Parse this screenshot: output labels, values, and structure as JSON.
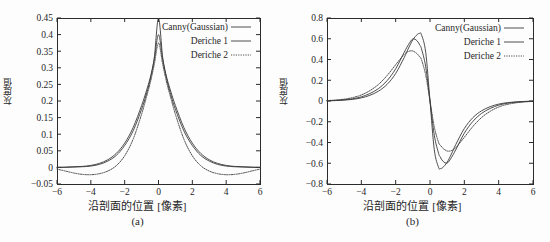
{
  "figure": {
    "background": "#fdfdfd",
    "axis_color": "#2b2b2b",
    "curve_color": "#3a3a3a"
  },
  "panels": [
    {
      "id": "a",
      "caption": "(a)",
      "xlabel": "沿剖面的位置 [像素]",
      "ylabel": "灰度值"
    },
    {
      "id": "b",
      "caption": "(b)",
      "xlabel": "沿剖面的位置 [像素]",
      "ylabel": "灰度值"
    }
  ],
  "legend": {
    "items": [
      {
        "label": "Canny(Gaussian)",
        "style": "solid"
      },
      {
        "label": "Deriche 1",
        "style": "solid"
      },
      {
        "label": "Deriche 2",
        "style": "dotted"
      }
    ]
  },
  "chart_data": [
    {
      "type": "line",
      "panel": "a",
      "title": "",
      "xlabel": "沿剖面的位置 [像素]",
      "ylabel": "灰度值",
      "xlim": [
        -6,
        6
      ],
      "ylim": [
        -0.05,
        0.45
      ],
      "xticks": [
        -6,
        -4,
        -2,
        0,
        2,
        4,
        6
      ],
      "yticks": [
        -0.05,
        0,
        0.05,
        0.1,
        0.15,
        0.2,
        0.25,
        0.3,
        0.35,
        0.4,
        0.45
      ],
      "ytick_labels": [
        "-0.05",
        "0",
        "0.05",
        "0.1",
        "0.15",
        "0.2",
        "0.25",
        "0.3",
        "0.35",
        "0.4",
        "0.45"
      ],
      "xtick_labels": [
        "-6",
        "-4",
        "-2",
        "0",
        "2",
        "4",
        "6"
      ],
      "grid": false,
      "legend_position": "top-right",
      "x": [
        -6,
        -5.5,
        -5,
        -4.5,
        -4,
        -3.5,
        -3,
        -2.5,
        -2,
        -1.5,
        -1,
        -0.75,
        -0.5,
        -0.25,
        0,
        0.25,
        0.5,
        0.75,
        1,
        1.5,
        2,
        2.5,
        3,
        3.5,
        4,
        4.5,
        5,
        5.5,
        6
      ],
      "series": [
        {
          "name": "Canny(Gaussian)",
          "style": "solid",
          "values": [
            0.0,
            0.0,
            0.001,
            0.002,
            0.004,
            0.009,
            0.019,
            0.036,
            0.066,
            0.11,
            0.175,
            0.215,
            0.262,
            0.33,
            0.45,
            0.33,
            0.262,
            0.215,
            0.175,
            0.11,
            0.066,
            0.036,
            0.019,
            0.009,
            0.004,
            0.002,
            0.001,
            0.0,
            0.0
          ]
        },
        {
          "name": "Deriche 1",
          "style": "solid",
          "values": [
            0.0,
            0.001,
            0.002,
            0.003,
            0.006,
            0.012,
            0.023,
            0.042,
            0.073,
            0.12,
            0.186,
            0.225,
            0.268,
            0.325,
            0.4,
            0.325,
            0.268,
            0.225,
            0.186,
            0.12,
            0.073,
            0.042,
            0.023,
            0.012,
            0.006,
            0.003,
            0.002,
            0.001,
            0.0
          ]
        },
        {
          "name": "Deriche 2",
          "style": "dotted",
          "values": [
            -0.005,
            -0.011,
            -0.017,
            -0.021,
            -0.022,
            -0.019,
            -0.011,
            0.005,
            0.035,
            0.085,
            0.16,
            0.205,
            0.252,
            0.31,
            0.375,
            0.31,
            0.252,
            0.205,
            0.16,
            0.085,
            0.035,
            0.005,
            -0.011,
            -0.019,
            -0.022,
            -0.021,
            -0.017,
            -0.011,
            -0.005
          ]
        }
      ],
      "annotations": {
        "peaks": [
          {
            "series": "Canny(Gaussian)",
            "x": 0,
            "y": 0.45
          },
          {
            "series": "Deriche 1",
            "x": 0,
            "y": 0.4
          },
          {
            "series": "Deriche 2",
            "x": 0,
            "y": 0.375
          }
        ],
        "undershoot": [
          {
            "series": "Deriche 2",
            "x": -4,
            "y": -0.022
          },
          {
            "series": "Deriche 2",
            "x": 4,
            "y": -0.022
          }
        ]
      }
    },
    {
      "type": "line",
      "panel": "b",
      "title": "",
      "xlabel": "沿剖面的位置 [像素]",
      "ylabel": "灰度值",
      "xlim": [
        -6,
        6
      ],
      "ylim": [
        -0.8,
        0.8
      ],
      "xticks": [
        -6,
        -4,
        -2,
        0,
        2,
        4,
        6
      ],
      "yticks": [
        -0.8,
        -0.6,
        -0.4,
        -0.2,
        0,
        0.2,
        0.4,
        0.6,
        0.8
      ],
      "ytick_labels": [
        "-0.8",
        "-0.6",
        "-0.4",
        "-0.2",
        "0",
        "0.2",
        "0.4",
        "0.6",
        "0.8"
      ],
      "xtick_labels": [
        "-6",
        "-4",
        "-2",
        "0",
        "2",
        "4",
        "6"
      ],
      "grid": false,
      "legend_position": "top-right",
      "x": [
        -6,
        -5.5,
        -5,
        -4.5,
        -4,
        -3.5,
        -3,
        -2.5,
        -2,
        -1.5,
        -1.25,
        -1,
        -0.75,
        -0.6,
        -0.5,
        -0.25,
        0,
        0.25,
        0.5,
        0.6,
        0.75,
        1,
        1.25,
        1.5,
        2,
        2.5,
        3,
        3.5,
        4,
        4.5,
        5,
        5.5,
        6
      ],
      "series": [
        {
          "name": "Canny(Gaussian)",
          "style": "solid",
          "values": [
            0.002,
            0.004,
            0.008,
            0.016,
            0.03,
            0.055,
            0.095,
            0.16,
            0.265,
            0.42,
            0.51,
            0.59,
            0.64,
            0.652,
            0.64,
            0.47,
            0.0,
            -0.47,
            -0.64,
            -0.652,
            -0.64,
            -0.59,
            -0.51,
            -0.42,
            -0.265,
            -0.16,
            -0.095,
            -0.055,
            -0.03,
            -0.016,
            -0.008,
            -0.004,
            -0.002
          ]
        },
        {
          "name": "Deriche 1",
          "style": "solid",
          "values": [
            0.003,
            0.006,
            0.012,
            0.022,
            0.04,
            0.072,
            0.12,
            0.196,
            0.31,
            0.47,
            0.545,
            0.598,
            0.58,
            0.54,
            0.505,
            0.33,
            0.0,
            -0.33,
            -0.505,
            -0.54,
            -0.58,
            -0.598,
            -0.545,
            -0.47,
            -0.31,
            -0.196,
            -0.12,
            -0.072,
            -0.04,
            -0.022,
            -0.012,
            -0.006,
            -0.003
          ]
        },
        {
          "name": "Deriche 2",
          "style": "dotted",
          "values": [
            0.004,
            0.009,
            0.018,
            0.033,
            0.058,
            0.1,
            0.16,
            0.245,
            0.35,
            0.45,
            0.478,
            0.482,
            0.455,
            0.425,
            0.4,
            0.25,
            0.0,
            -0.25,
            -0.4,
            -0.425,
            -0.455,
            -0.482,
            -0.478,
            -0.45,
            -0.35,
            -0.245,
            -0.16,
            -0.1,
            -0.058,
            -0.033,
            -0.018,
            -0.009,
            -0.004
          ]
        }
      ],
      "annotations": {
        "peaks": [
          {
            "series": "Canny(Gaussian)",
            "x": -0.6,
            "y": 0.652
          },
          {
            "series": "Deriche 1",
            "x": -1.0,
            "y": 0.598
          },
          {
            "series": "Deriche 2",
            "x": -1.1,
            "y": 0.482
          }
        ],
        "troughs": [
          {
            "series": "Canny(Gaussian)",
            "x": 0.6,
            "y": -0.652
          },
          {
            "series": "Deriche 1",
            "x": 1.0,
            "y": -0.598
          },
          {
            "series": "Deriche 2",
            "x": 1.1,
            "y": -0.482
          }
        ]
      }
    }
  ]
}
